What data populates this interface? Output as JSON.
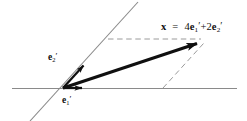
{
  "figure": {
    "kind": "vector-decomposition-diagram",
    "width": 247,
    "height": 121,
    "background_color": "#ffffff",
    "axis_color": "#8a8a8a",
    "vector_color": "#101010",
    "dashed_color": "#9a9a9a",
    "text_color": "#0d0d0d"
  },
  "labels": {
    "x_vector_symbol": "x",
    "equals": "=",
    "coefficient_1": "4",
    "basis_1_symbol": "e",
    "basis_1_subscript": "1",
    "basis_1_prime": "′",
    "plus": "+",
    "coefficient_2": "2",
    "basis_2_symbol": "e",
    "basis_2_subscript": "2",
    "basis_2_prime": "′",
    "equation_plain": "x = 4e₁′ + 2e₂′",
    "e1_label_plain": "e₁′",
    "e2_label_plain": "e₂′"
  },
  "geometry": {
    "origin": {
      "x": 63,
      "y": 88
    },
    "horizontal_axis": {
      "x1": 12,
      "y1": 88,
      "x2": 237,
      "y2": 88
    },
    "oblique_axis": {
      "x1": 30,
      "y1": 121,
      "x2": 138,
      "y2": 2
    },
    "e1_arrow": {
      "x1": 63,
      "y1": 88,
      "x2": 88,
      "y2": 88
    },
    "e2_arrow": {
      "x1": 63,
      "y1": 88,
      "x2": 89,
      "y2": 60
    },
    "x_arrow": {
      "x1": 63,
      "y1": 88,
      "x2": 205,
      "y2": 41
    },
    "dashed_horizontal": {
      "x1": 108,
      "y1": 39,
      "x2": 202,
      "y2": 39
    },
    "dashed_oblique": {
      "x1": 163,
      "y1": 88,
      "x2": 204,
      "y2": 43
    }
  }
}
